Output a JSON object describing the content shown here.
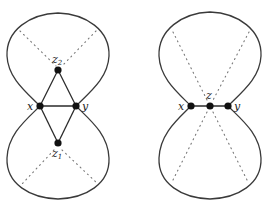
{
  "figures": [
    {
      "id": "left",
      "labels": {
        "x": "x",
        "y": "y",
        "z2": "z",
        "z2_sub": "2",
        "z1": "z",
        "z1_sub": "1"
      }
    },
    {
      "id": "right",
      "labels": {
        "x": "x",
        "y": "y",
        "z": "z"
      }
    }
  ],
  "colors": {
    "stroke": "#3a3a3a",
    "node": "#111111",
    "dotted": "#777777"
  }
}
